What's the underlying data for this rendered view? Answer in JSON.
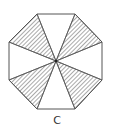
{
  "figure": {
    "caption": "C",
    "shape": "octagon",
    "center": [
      56,
      61
    ],
    "vertices": [
      [
        37,
        14
      ],
      [
        75,
        14
      ],
      [
        102,
        42
      ],
      [
        102,
        80
      ],
      [
        75,
        109
      ],
      [
        37,
        109
      ],
      [
        9,
        80
      ],
      [
        9,
        42
      ]
    ],
    "hatched_sectors": [
      {
        "name": "top-left",
        "points": [
          [
            56,
            61
          ],
          [
            37,
            14
          ],
          [
            9,
            42
          ]
        ]
      },
      {
        "name": "top-right",
        "points": [
          [
            56,
            61
          ],
          [
            75,
            14
          ],
          [
            102,
            42
          ]
        ]
      },
      {
        "name": "bottom-right",
        "points": [
          [
            56,
            61
          ],
          [
            102,
            80
          ],
          [
            75,
            109
          ]
        ]
      },
      {
        "name": "bottom-left",
        "points": [
          [
            56,
            61
          ],
          [
            9,
            80
          ],
          [
            37,
            109
          ]
        ]
      }
    ],
    "colors": {
      "stroke": "#555555",
      "hatch": "#555555",
      "background": "#ffffff"
    }
  }
}
